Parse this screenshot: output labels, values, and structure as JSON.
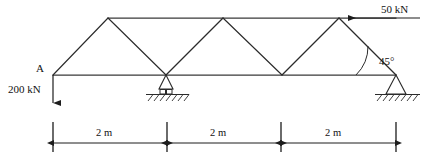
{
  "diagram": {
    "type": "truss-free-body-diagram",
    "labels": {
      "node_a": "A",
      "load_left": "200 kN",
      "load_top": "50 kN",
      "angle": "45°"
    },
    "loads": [
      {
        "name": "vertical-point-load-at-a",
        "magnitude": "200 kN",
        "direction": "down",
        "applied_at": "A",
        "label": "200 kN"
      },
      {
        "name": "horizontal-point-load-top-right",
        "magnitude": "50 kN",
        "direction": "left",
        "applied_at": "top-right-node",
        "label": "50 kN"
      }
    ],
    "supports": [
      {
        "name": "roller-support-middle",
        "kind": "roller",
        "position_m": 2
      },
      {
        "name": "pin-support-right",
        "kind": "pin",
        "position_m": 6
      }
    ],
    "angle": {
      "value": "45°",
      "between": "bottom chord and right diagonal"
    },
    "dimensions": {
      "unit": "m",
      "segments": [
        {
          "label": "2 m",
          "value": 2
        },
        {
          "label": "2 m",
          "value": 2
        },
        {
          "label": "2 m",
          "value": 2
        }
      ],
      "total_label": "6 m"
    },
    "colors": {
      "member": "#2b2b2b",
      "chord": "#3a3a3a",
      "load": "#1d1d1d",
      "dimension": "#1d1d1d",
      "background": "#ffffff"
    }
  }
}
